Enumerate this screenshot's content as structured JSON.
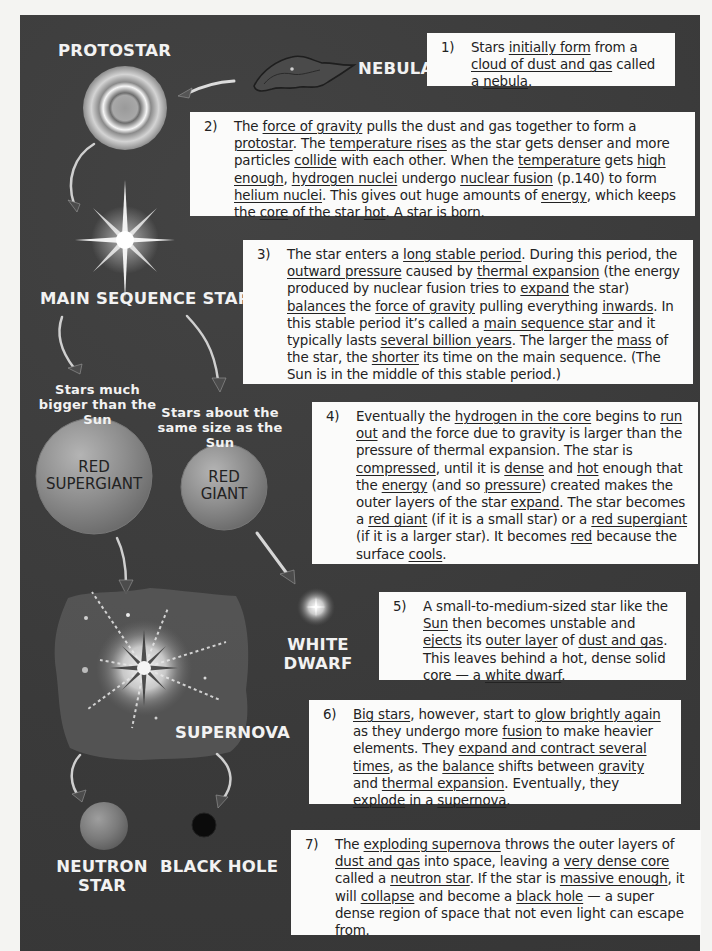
{
  "stages": {
    "nebula": "NEBULA",
    "protostar": "PROTOSTAR",
    "main_sequence": "MAIN SEQUENCE STAR",
    "bigger_caption": "Stars much bigger than the Sun",
    "same_caption": "Stars about the same size as the Sun",
    "red_supergiant": "RED SUPERGIANT",
    "red_giant": "RED GIANT",
    "white_dwarf": "WHITE DWARF",
    "supernova": "SUPERNOVA",
    "neutron_star": "NEUTRON STAR",
    "black_hole": "BLACK HOLE"
  },
  "steps": [
    {
      "num": "1)",
      "segments": [
        {
          "t": "Stars "
        },
        {
          "t": "initially form",
          "u": true
        },
        {
          "t": " from a "
        },
        {
          "t": "cloud of dust and gas",
          "u": true
        },
        {
          "t": " called a "
        },
        {
          "t": "nebula",
          "u": true
        },
        {
          "t": "."
        }
      ]
    },
    {
      "num": "2)",
      "segments": [
        {
          "t": "The "
        },
        {
          "t": "force of gravity",
          "u": true
        },
        {
          "t": " pulls the dust and gas together to form a "
        },
        {
          "t": "protostar",
          "u": true
        },
        {
          "t": ". The "
        },
        {
          "t": "temperature rises",
          "u": true
        },
        {
          "t": " as the star gets denser and more particles "
        },
        {
          "t": "collide",
          "u": true
        },
        {
          "t": " with each other.  When the "
        },
        {
          "t": "temperature",
          "u": true
        },
        {
          "t": " gets "
        },
        {
          "t": "high enough",
          "u": true
        },
        {
          "t": ", "
        },
        {
          "t": "hydrogen nuclei",
          "u": true
        },
        {
          "t": " undergo "
        },
        {
          "t": "nuclear fusion",
          "u": true
        },
        {
          "t": " (p.140) to form "
        },
        {
          "t": "helium nuclei",
          "u": true
        },
        {
          "t": ".  This gives out huge amounts of "
        },
        {
          "t": "energy",
          "u": true
        },
        {
          "t": ", which keeps the "
        },
        {
          "t": "core",
          "u": true
        },
        {
          "t": " of the star "
        },
        {
          "t": "hot",
          "u": true
        },
        {
          "t": ".  A star is born."
        }
      ]
    },
    {
      "num": "3)",
      "segments": [
        {
          "t": "The star enters a "
        },
        {
          "t": "long stable period",
          "u": true
        },
        {
          "t": ".  During this period, the "
        },
        {
          "t": "outward pressure",
          "u": true
        },
        {
          "t": " caused by "
        },
        {
          "t": "thermal expansion",
          "u": true
        },
        {
          "t": " (the energy produced by nuclear fusion tries to "
        },
        {
          "t": "expand",
          "u": true
        },
        {
          "t": " the star) "
        },
        {
          "t": "balances",
          "u": true
        },
        {
          "t": " the "
        },
        {
          "t": "force of gravity",
          "u": true
        },
        {
          "t": " pulling everything "
        },
        {
          "t": "inwards",
          "u": true
        },
        {
          "t": ".  In this stable period it’s called a "
        },
        {
          "t": "main sequence star",
          "u": true
        },
        {
          "t": " and it typically lasts "
        },
        {
          "t": "several billion years",
          "u": true
        },
        {
          "t": ".  The larger the "
        },
        {
          "t": "mass",
          "u": true
        },
        {
          "t": " of the star, the "
        },
        {
          "t": "shorter",
          "u": true
        },
        {
          "t": " its time on the main sequence.  (The Sun is in the middle of this stable period.)"
        }
      ]
    },
    {
      "num": "4)",
      "segments": [
        {
          "t": "Eventually the "
        },
        {
          "t": "hydrogen in the core",
          "u": true
        },
        {
          "t": " begins to "
        },
        {
          "t": "run out",
          "u": true
        },
        {
          "t": " and the force due to gravity is larger than the pressure of thermal expansion.  The star is "
        },
        {
          "t": "compressed",
          "u": true
        },
        {
          "t": ", until it is "
        },
        {
          "t": "dense",
          "u": true
        },
        {
          "t": " and "
        },
        {
          "t": "hot",
          "u": true
        },
        {
          "t": " enough that the "
        },
        {
          "t": "energy",
          "u": true
        },
        {
          "t": " (and so "
        },
        {
          "t": "pressure",
          "u": true
        },
        {
          "t": ") created makes the outer layers of the star "
        },
        {
          "t": "expand",
          "u": true
        },
        {
          "t": ".  The star becomes a "
        },
        {
          "t": "red giant",
          "u": true
        },
        {
          "t": " (if it is a small star) or a "
        },
        {
          "t": "red supergiant",
          "u": true
        },
        {
          "t": " (if it is a larger star). It becomes "
        },
        {
          "t": "red",
          "u": true
        },
        {
          "t": " because the surface "
        },
        {
          "t": "cools",
          "u": true
        },
        {
          "t": "."
        }
      ]
    },
    {
      "num": "5)",
      "segments": [
        {
          "t": "A small-to-medium-sized star like the "
        },
        {
          "t": "Sun",
          "u": true
        },
        {
          "t": " then becomes unstable and "
        },
        {
          "t": "ejects",
          "u": true
        },
        {
          "t": " its "
        },
        {
          "t": "outer layer",
          "u": true
        },
        {
          "t": " of "
        },
        {
          "t": "dust and gas",
          "u": true
        },
        {
          "t": ".  This leaves behind a hot, dense solid core — a "
        },
        {
          "t": "white dwarf",
          "u": true
        },
        {
          "t": "."
        }
      ]
    },
    {
      "num": "6)",
      "segments": [
        {
          "t": "Big stars",
          "u": true
        },
        {
          "t": ", however, start to "
        },
        {
          "t": "glow brightly again",
          "u": true
        },
        {
          "t": " as they undergo more "
        },
        {
          "t": "fusion",
          "u": true
        },
        {
          "t": " to make heavier elements.  They "
        },
        {
          "t": "expand and contract several times",
          "u": true
        },
        {
          "t": ", as the "
        },
        {
          "t": "balance",
          "u": true
        },
        {
          "t": " shifts between "
        },
        {
          "t": "gravity",
          "u": true
        },
        {
          "t": " and "
        },
        {
          "t": "thermal expansion",
          "u": true
        },
        {
          "t": ".  Eventually, they "
        },
        {
          "t": "explode",
          "u": true
        },
        {
          "t": " in a "
        },
        {
          "t": "supernova",
          "u": true
        },
        {
          "t": "."
        }
      ]
    },
    {
      "num": "7)",
      "segments": [
        {
          "t": "The "
        },
        {
          "t": "exploding supernova",
          "u": true
        },
        {
          "t": " throws the outer layers of "
        },
        {
          "t": "dust and gas",
          "u": true
        },
        {
          "t": " into space, leaving a "
        },
        {
          "t": "very dense core",
          "u": true
        },
        {
          "t": " called a "
        },
        {
          "t": "neutron star",
          "u": true
        },
        {
          "t": ".  If the star is "
        },
        {
          "t": "massive enough",
          "u": true
        },
        {
          "t": ", it will "
        },
        {
          "t": "collapse",
          "u": true
        },
        {
          "t": " and become a "
        },
        {
          "t": "black hole",
          "u": true
        },
        {
          "t": " — a super dense region of space that not even light can escape from."
        }
      ]
    }
  ],
  "colors": {
    "panel": "#3c3c3c",
    "box": "#fbfbfa",
    "label": "#f2f2f2",
    "sphere": "#8a8a8a"
  }
}
